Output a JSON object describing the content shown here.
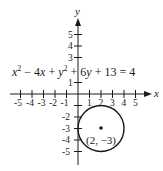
{
  "figure": {
    "type": "coordinate-graph",
    "x_axis_label": "x",
    "y_axis_label": "y",
    "x_ticks": [
      "-5",
      "-4",
      "-3",
      "-2",
      "-1",
      "1",
      "2",
      "3",
      "4",
      "5"
    ],
    "y_ticks_positive": [
      "1",
      "3",
      "4",
      "5"
    ],
    "y_ticks_negative": [
      "-2",
      "-3",
      "-4",
      "-5"
    ],
    "equation": {
      "parts": [
        "x",
        "2",
        " − 4",
        "x",
        " + ",
        "y",
        "2",
        " + 6",
        "y",
        " + 13 = 4"
      ]
    },
    "circle": {
      "center": [
        2,
        -3
      ],
      "radius": 2,
      "center_label": "(2, −3)"
    },
    "colors": {
      "ink": "#1a1a1a",
      "background": "#ffffff"
    }
  }
}
